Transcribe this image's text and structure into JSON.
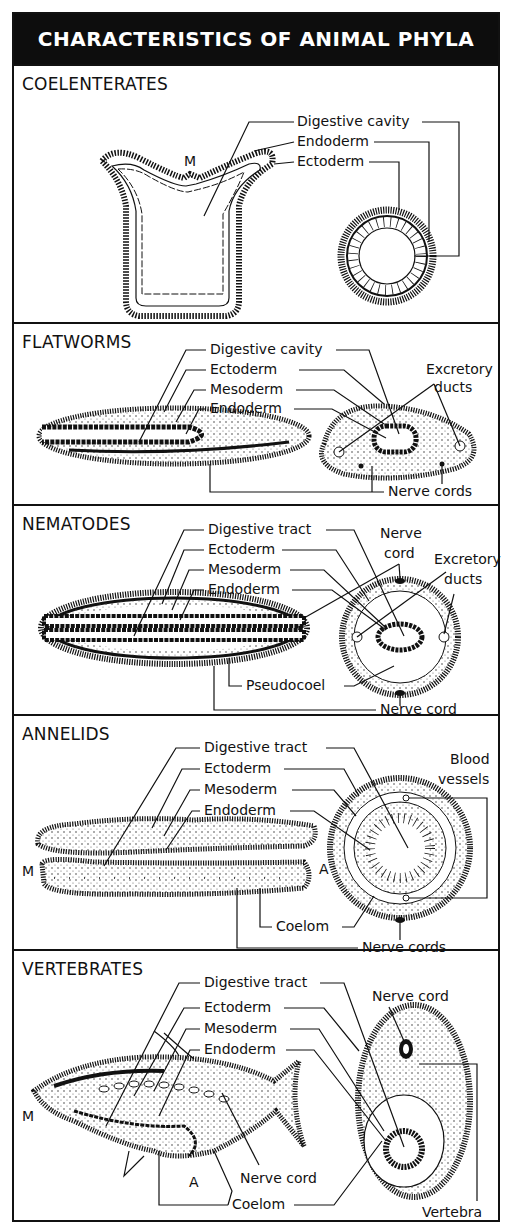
{
  "title": "CHARACTERISTICS OF ANIMAL PHYLA",
  "panels": [
    {
      "name": "COELENTERATES",
      "labels": [
        "Digestive cavity",
        "Endoderm",
        "Ectoderm"
      ],
      "markers": [
        "M"
      ]
    },
    {
      "name": "FLATWORMS",
      "labels": [
        "Digestive cavity",
        "Ectoderm",
        "Mesoderm",
        "Endoderm",
        "Excretory",
        "ducts",
        "Nerve cords"
      ]
    },
    {
      "name": "NEMATODES",
      "labels": [
        "Digestive tract",
        "Ectoderm",
        "Mesoderm",
        "Endoderm",
        "Nerve",
        "cord",
        "Excretory",
        "ducts",
        "Pseudocoel",
        "Nerve cord"
      ]
    },
    {
      "name": "ANNELIDS",
      "labels": [
        "Digestive tract",
        "Ectoderm",
        "Mesoderm",
        "Endoderm",
        "Blood",
        "vessels",
        "Coelom",
        "Nerve cords"
      ],
      "markers": [
        "M",
        "A"
      ]
    },
    {
      "name": "VERTEBRATES",
      "labels": [
        "Digestive tract",
        "Ectoderm",
        "Mesoderm",
        "Endoderm",
        "Nerve cord",
        "Nerve cord",
        "Coelom",
        "Vertebra"
      ],
      "markers": [
        "M",
        "A"
      ]
    }
  ],
  "colors": {
    "ink": "#111111",
    "paper": "#ffffff",
    "title_bg": "#0d0d0d",
    "stipple": "#bdbdbd"
  }
}
